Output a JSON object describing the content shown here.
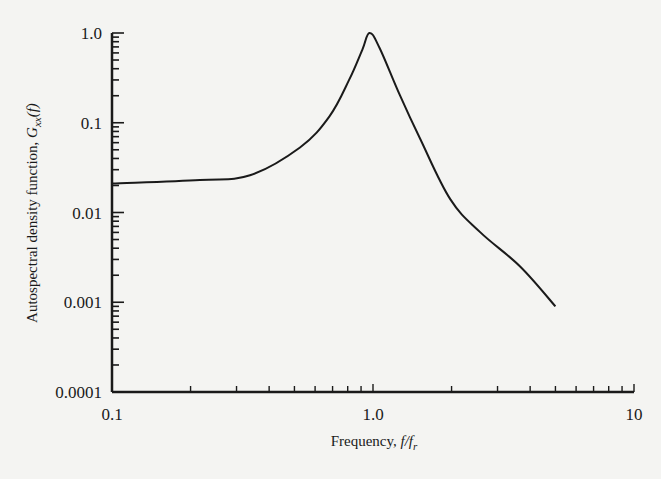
{
  "chart_data": {
    "type": "line",
    "title": "",
    "xlabel": "Frequency, f/f_r",
    "xlabel_parts": {
      "main": "Frequency, ",
      "var": "f/f",
      "sub": "r"
    },
    "ylabel": "Autospectral density function, G_xx(f)",
    "ylabel_parts": {
      "main": "Autospectral density function, ",
      "var": "G",
      "sub": "xx",
      "arg": "(f)"
    },
    "xscale": "log",
    "yscale": "log",
    "xlim": [
      0.1,
      10
    ],
    "ylim": [
      0.0001,
      1.0
    ],
    "x_tick_labels": [
      "0.1",
      "1.0",
      "10"
    ],
    "y_tick_labels": [
      "1.0",
      "0.1",
      "0.01",
      "0.001",
      "0.0001"
    ],
    "grid": false,
    "legend": null,
    "series": [
      {
        "name": "G_xx(f)",
        "color": "#1a1a1a",
        "x": [
          0.1,
          0.217,
          0.338,
          0.525,
          0.68,
          0.81,
          0.91,
          0.97,
          1.06,
          1.27,
          1.52,
          1.98,
          2.58,
          3.66,
          5.0
        ],
        "y": [
          0.021,
          0.023,
          0.026,
          0.053,
          0.117,
          0.3,
          0.65,
          1.0,
          0.68,
          0.2,
          0.065,
          0.014,
          0.006,
          0.0025,
          0.0009
        ]
      }
    ]
  },
  "plot": {
    "left": 112,
    "right": 634,
    "top": 33,
    "bottom": 392,
    "axis_color": "#1a1a1a",
    "background": "#f4f4f2"
  }
}
